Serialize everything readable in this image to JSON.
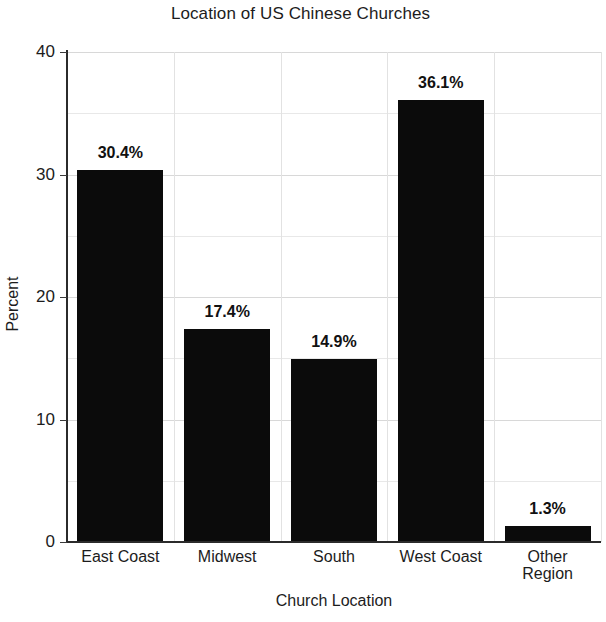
{
  "chart_data": {
    "type": "bar",
    "title": "Location of US Chinese Churches",
    "xlabel": "Church Location",
    "ylabel": "Percent",
    "categories": [
      "East Coast",
      "Midwest",
      "South",
      "West Coast",
      "Other Region"
    ],
    "category_lines": [
      [
        "East Coast"
      ],
      [
        "Midwest"
      ],
      [
        "South"
      ],
      [
        "West Coast"
      ],
      [
        "Other",
        "Region"
      ]
    ],
    "values": [
      30.4,
      17.4,
      14.9,
      36.1,
      1.3
    ],
    "value_labels": [
      "30.4%",
      "17.4%",
      "14.9%",
      "36.1%",
      "1.3%"
    ],
    "ylim": [
      0,
      40
    ],
    "yticks": [
      0,
      10,
      20,
      30,
      40
    ],
    "ytick_labels": [
      "0",
      "10",
      "20",
      "30",
      "40"
    ],
    "minor_yticks": [
      5,
      15,
      25,
      35
    ],
    "grid": true,
    "legend": null,
    "bar_color": "#0b0b0b",
    "grid_color": "#d8d8d8",
    "axis_color": "#2b2b2b",
    "background": "#ffffff"
  }
}
